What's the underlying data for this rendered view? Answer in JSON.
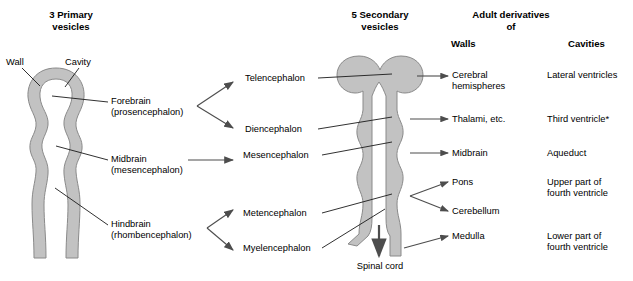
{
  "figure": {
    "title_absent": true,
    "columns": {
      "primary_heading": "3 Primary\nvesicles",
      "secondary_heading": "5 Secondary\nvesicles",
      "adult_heading": "Adult derivatives\nof",
      "walls_heading": "Walls",
      "cavities_heading": "Cavities"
    },
    "callouts": {
      "wall": "Wall",
      "cavity": "Cavity",
      "spinal_cord": "Spinal cord"
    },
    "primary_vesicles": [
      {
        "id": "forebrain",
        "label": "Forebrain\n(prosencephalon)"
      },
      {
        "id": "midbrain",
        "label": "Midbrain\n(mesencephalon)"
      },
      {
        "id": "hindbrain",
        "label": "Hindbrain\n(rhombencephalon)"
      }
    ],
    "secondary_vesicles": [
      {
        "id": "telencephalon",
        "label": "Telencephalon"
      },
      {
        "id": "diencephalon",
        "label": "Diencephalon"
      },
      {
        "id": "mesencephalon",
        "label": "Mesencephalon"
      },
      {
        "id": "metencephalon",
        "label": "Metencephalon"
      },
      {
        "id": "myelencephalon",
        "label": "Myelencephalon"
      }
    ],
    "adult_walls": [
      {
        "id": "cerebral-hemispheres",
        "label": "Cerebral\nhemispheres"
      },
      {
        "id": "thalami",
        "label": "Thalami, etc."
      },
      {
        "id": "midbrain-adult",
        "label": "Midbrain"
      },
      {
        "id": "pons",
        "label": "Pons"
      },
      {
        "id": "cerebellum",
        "label": "Cerebellum"
      },
      {
        "id": "medulla",
        "label": "Medulla"
      }
    ],
    "adult_cavities": [
      {
        "id": "lateral-ventricles",
        "label": "Lateral ventricles"
      },
      {
        "id": "third-ventricle",
        "label": "Third ventricle*"
      },
      {
        "id": "aqueduct",
        "label": "Aqueduct"
      },
      {
        "id": "upper-fourth",
        "label": "Upper part of\nfourth ventricle"
      },
      {
        "id": "lower-fourth",
        "label": "Lower part of\nfourth ventricle"
      }
    ],
    "colors": {
      "wall_fill": "#c2c2c2",
      "wall_stroke": "#8a8a8a",
      "leader_line": "#1a1a1a",
      "arrow": "#4d4d4d",
      "text": "#000000",
      "background": "#ffffff"
    }
  }
}
